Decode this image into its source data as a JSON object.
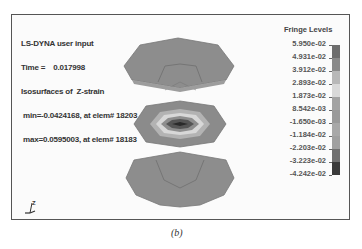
{
  "info": {
    "line1": "LS-DYNA user input",
    "line2": "Time =    0.017998",
    "line3": "Isosurfaces of  Z-strain",
    "line4": " min=-0.0424168, at elem# 18203",
    "line5": " max=0.0595003, at elem# 18183"
  },
  "legend": {
    "title": "Fringe Levels",
    "labels": [
      "5.950e-02",
      "4.931e-02",
      "3.912e-02",
      "2.893e-02",
      "1.873e-02",
      "8.542e-03",
      "-1.650e-03",
      "-1.184e-02",
      "-2.203e-02",
      "-3.223e-02",
      "-4.242e-02"
    ],
    "colors": [
      "#6e6e6e",
      "#8a8a8a",
      "#b8b8b8",
      "#d9d9d9",
      "#a3a3a3",
      "#9a9a9a",
      "#a8a8a8",
      "#a0a0a0",
      "#707070",
      "#3a3a3a"
    ]
  },
  "triad": {
    "z": "Z",
    "x": "X",
    "y": "Y"
  },
  "caption": "(b)"
}
